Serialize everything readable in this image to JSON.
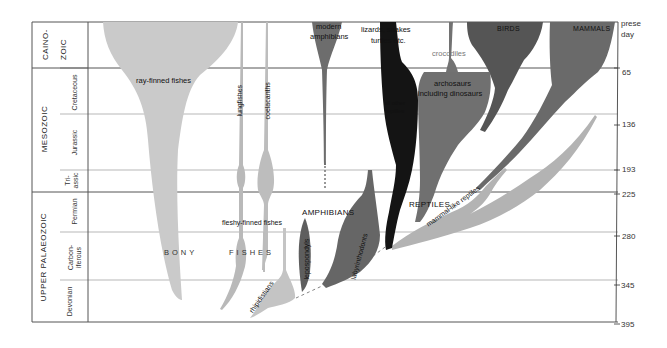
{
  "figure": {
    "time_axis": {
      "unit": "million years ago",
      "ticks": [
        {
          "label": "present day",
          "value": 0
        },
        {
          "label": "65",
          "value": 65
        },
        {
          "label": "136",
          "value": 136
        },
        {
          "label": "193",
          "value": 193
        },
        {
          "label": "225",
          "value": 225
        },
        {
          "label": "280",
          "value": 280
        },
        {
          "label": "345",
          "value": 345
        },
        {
          "label": "395",
          "value": 395
        }
      ],
      "present_line1": "prese",
      "present_line2": "day"
    },
    "eras": [
      {
        "label": "CAINO-\nZOIC",
        "line1": "CAINO-",
        "line2": "ZOIC"
      },
      {
        "label": "MESOZOIC"
      },
      {
        "label": "UPPER PALAEOZOIC"
      }
    ],
    "periods": [
      {
        "label": "Cretaceous"
      },
      {
        "label": "Jurassic"
      },
      {
        "label": "Tri-\nassic",
        "line1": "Tri-",
        "line2": "assic"
      },
      {
        "label": "Permian"
      },
      {
        "label": "Carbon-\niferous",
        "line1": "Carbon-",
        "line2": "iferous"
      },
      {
        "label": "Devonian"
      }
    ],
    "taxa": {
      "ray_finned": "ray-finned fishes",
      "lungfishes": "lungfishes",
      "coelacanths": "coelacanths",
      "fleshy_finned": "fleshy-finned fishes",
      "bony": "BONY",
      "fishes": "FISHES",
      "rhipidistians": "rhipidistians",
      "lepospondyls": "lepospondyls",
      "amphibians": "AMPHIBIANS",
      "labyrinthodonts": "labyrinthodonts",
      "modern_amph_1": "modern",
      "modern_amph_2": "amphibians",
      "lizards_1": "lizards, snakes",
      "lizards_2": "turtles etc.",
      "other_reptiles_1": "all other",
      "other_reptiles_2": "reptiles",
      "crocodiles": "crocodiles",
      "archosaurs_1": "archosaurs",
      "archosaurs_2": "including dinosaurs",
      "birds": "BIRDS",
      "mammals": "MAMMALS",
      "reptiles": "REPTILES",
      "mammal_like": "mammal-like reptiles"
    },
    "colors": {
      "fish_grey": "#c9c9c9",
      "fish_mid": "#b4b4b4",
      "amphibian": "#6a6a6a",
      "reptile_dark": "#161616",
      "archosaur": "#6e6e6e",
      "bird": "#585858",
      "mammal": "#6c6c6c",
      "mammal_like": "#b2b2b2",
      "grid": "#555555"
    }
  }
}
